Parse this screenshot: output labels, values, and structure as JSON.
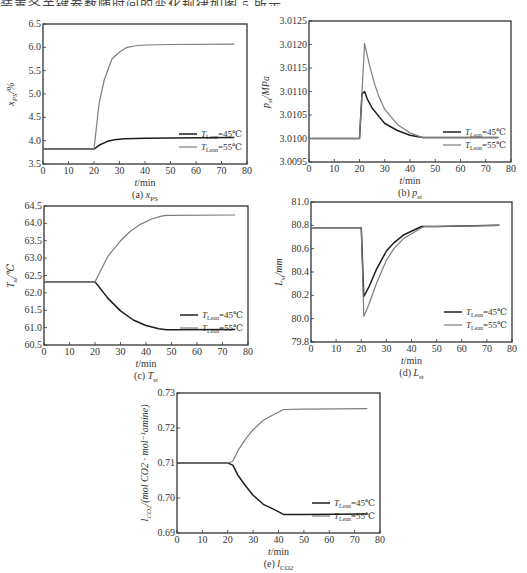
{
  "header_text": "装置各关键参数随时间的变化规律如图 5 所示。",
  "legend": {
    "series_45": "T_Lean=45℃",
    "series_55": "T_Lean=55℃"
  },
  "colors": {
    "series_45": "#1e1e1e",
    "series_55": "#7d7d7d",
    "axis": "#333333"
  },
  "chart_data": [
    {
      "id": "a",
      "type": "line",
      "title": "",
      "caption": "(a) x_PS",
      "xlabel": "t/min",
      "ylabel": "x_PS/%",
      "xlim": [
        0,
        80
      ],
      "ylim": [
        3.5,
        6.5
      ],
      "xticks": [
        0,
        10,
        20,
        30,
        40,
        50,
        60,
        70,
        80
      ],
      "yticks": [
        3.5,
        4.0,
        4.5,
        5.0,
        5.5,
        6.0,
        6.5
      ],
      "ytick_labels": [
        "3.5",
        "4.0",
        "4.5",
        "5.0",
        "5.5",
        "6.0",
        "6.5"
      ],
      "grid": false,
      "legend_position": "lower right",
      "frame": {
        "left": 43,
        "top": 24,
        "right": 247,
        "bottom": 164
      },
      "series": [
        {
          "name": "T_Lean=45℃",
          "x": [
            0,
            20,
            22,
            25,
            28,
            32,
            40,
            50,
            75
          ],
          "y": [
            3.82,
            3.82,
            3.9,
            3.98,
            4.02,
            4.04,
            4.05,
            4.06,
            4.07
          ]
        },
        {
          "name": "T_Lean=55℃",
          "x": [
            0,
            20,
            22,
            24,
            27,
            30,
            33,
            37,
            40,
            50,
            75
          ],
          "y": [
            3.82,
            3.82,
            4.8,
            5.3,
            5.75,
            5.9,
            6.0,
            6.04,
            6.05,
            6.06,
            6.07
          ]
        }
      ]
    },
    {
      "id": "b",
      "type": "line",
      "title": "",
      "caption": "(b) p_st",
      "xlabel": "t/min",
      "ylabel": "p_st/MPa",
      "xlim": [
        0,
        80
      ],
      "ylim": [
        3.0095,
        3.0125
      ],
      "xticks": [
        0,
        10,
        20,
        30,
        40,
        50,
        60,
        70,
        80
      ],
      "yticks": [
        3.0095,
        3.01,
        3.0105,
        3.011,
        3.0115,
        3.012,
        3.0125
      ],
      "ytick_labels": [
        "3.0095",
        "3.0100",
        "3.0105",
        "3.0110",
        "3.0115",
        "3.0120",
        "3.0125"
      ],
      "grid": false,
      "legend_position": "lower right",
      "frame": {
        "left": 309,
        "top": 21,
        "right": 511,
        "bottom": 162
      },
      "series": [
        {
          "name": "T_Lean=45℃",
          "x": [
            0,
            20,
            21,
            22,
            23,
            25,
            28,
            30,
            35,
            40,
            45,
            50,
            75
          ],
          "y": [
            3.01,
            3.01,
            3.01095,
            3.011,
            3.01085,
            3.01065,
            3.01045,
            3.01032,
            3.01017,
            3.01007,
            3.01002,
            3.01002,
            3.01002
          ]
        },
        {
          "name": "T_Lean=55℃",
          "x": [
            0,
            20,
            22,
            24,
            26,
            28,
            30,
            35,
            40,
            45,
            50,
            75
          ],
          "y": [
            3.01,
            3.01,
            3.01202,
            3.01155,
            3.01115,
            3.01085,
            3.01062,
            3.0103,
            3.01012,
            3.01002,
            3.01002,
            3.01002
          ]
        }
      ]
    },
    {
      "id": "c",
      "type": "line",
      "title": "",
      "caption": "(c) T_st",
      "xlabel": "t/min",
      "ylabel": "T_st/℃",
      "xlim": [
        0,
        80
      ],
      "ylim": [
        60.5,
        64.5
      ],
      "xticks": [
        0,
        10,
        20,
        30,
        40,
        50,
        60,
        70,
        80
      ],
      "yticks": [
        60.5,
        61.0,
        61.5,
        62.0,
        62.5,
        63.0,
        63.5,
        64.0,
        64.5
      ],
      "ytick_labels": [
        "60.5",
        "61.0",
        "61.5",
        "62.0",
        "62.5",
        "63.0",
        "63.5",
        "64.0",
        "64.5"
      ],
      "grid": false,
      "legend_position": "lower right",
      "frame": {
        "left": 44,
        "top": 206,
        "right": 248,
        "bottom": 345
      },
      "series": [
        {
          "name": "T_Lean=45℃",
          "x": [
            0,
            20,
            25,
            30,
            35,
            40,
            45,
            48,
            50,
            75
          ],
          "y": [
            62.32,
            62.32,
            61.85,
            61.48,
            61.22,
            61.06,
            60.97,
            60.94,
            60.94,
            60.95
          ]
        },
        {
          "name": "T_Lean=55℃",
          "x": [
            0,
            20,
            25,
            30,
            34,
            38,
            42,
            46,
            48,
            50,
            75
          ],
          "y": [
            62.32,
            62.32,
            63.05,
            63.5,
            63.78,
            63.98,
            64.12,
            64.21,
            64.23,
            64.23,
            64.24
          ]
        }
      ]
    },
    {
      "id": "d",
      "type": "line",
      "title": "",
      "caption": "(d) L_st",
      "xlabel": "t/min",
      "ylabel": "L_st/mm",
      "xlim": [
        0,
        80
      ],
      "ylim": [
        79.8,
        81.0
      ],
      "xticks": [
        0,
        10,
        20,
        30,
        40,
        50,
        60,
        70,
        80
      ],
      "yticks": [
        79.8,
        80.0,
        80.2,
        80.4,
        80.6,
        80.8,
        81.0
      ],
      "ytick_labels": [
        "79.8",
        "80.0",
        "80.2",
        "80.4",
        "80.6",
        "80.8",
        "81.0"
      ],
      "grid": false,
      "legend_position": "lower right",
      "frame": {
        "left": 311,
        "top": 202,
        "right": 512,
        "bottom": 342
      },
      "series": [
        {
          "name": "T_Lean=45℃",
          "x": [
            0,
            20,
            21,
            23,
            26,
            30,
            33,
            37,
            41,
            44,
            50,
            75
          ],
          "y": [
            80.78,
            80.78,
            80.19,
            80.27,
            80.42,
            80.58,
            80.65,
            80.72,
            80.76,
            80.79,
            80.79,
            80.8
          ]
        },
        {
          "name": "T_Lean=55℃",
          "x": [
            0,
            20,
            21,
            23,
            26,
            30,
            33,
            37,
            41,
            45,
            50,
            75
          ],
          "y": [
            80.78,
            80.78,
            80.02,
            80.12,
            80.3,
            80.5,
            80.6,
            80.69,
            80.74,
            80.79,
            80.79,
            80.8
          ]
        }
      ]
    },
    {
      "id": "e",
      "type": "line",
      "title": "",
      "caption": "(e) l_CO2",
      "xlabel": "t/min",
      "ylabel": "l_CO2/(mol CO2 · mol⁻¹amine)",
      "xlim": [
        0,
        80
      ],
      "ylim": [
        0.69,
        0.73
      ],
      "xticks": [
        0,
        10,
        20,
        30,
        40,
        50,
        60,
        70,
        80
      ],
      "yticks": [
        0.69,
        0.7,
        0.71,
        0.72,
        0.73
      ],
      "ytick_labels": [
        "0.69",
        "0.70",
        "0.71",
        "0.72",
        "0.73"
      ],
      "grid": false,
      "legend_position": "lower right",
      "frame": {
        "left": 177,
        "top": 393,
        "right": 380,
        "bottom": 533
      },
      "series": [
        {
          "name": "T_Lean=45℃",
          "x": [
            0,
            20,
            22,
            24,
            27,
            30,
            34,
            38,
            42,
            50,
            75
          ],
          "y": [
            0.71,
            0.71,
            0.7094,
            0.7065,
            0.7035,
            0.7008,
            0.6982,
            0.6968,
            0.6953,
            0.6953,
            0.6954
          ]
        },
        {
          "name": "T_Lean=55℃",
          "x": [
            0,
            20,
            22,
            24,
            27,
            30,
            34,
            38,
            42,
            50,
            75
          ],
          "y": [
            0.71,
            0.71,
            0.7105,
            0.7135,
            0.7168,
            0.7195,
            0.7222,
            0.7238,
            0.7253,
            0.7254,
            0.7255
          ]
        }
      ]
    }
  ]
}
